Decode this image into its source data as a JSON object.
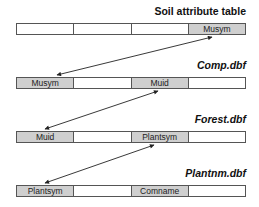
{
  "tables": [
    {
      "title": "Soil attribute table",
      "italic": false,
      "cells": [
        "",
        "",
        "",
        "Musym"
      ],
      "highlight": [
        3
      ]
    },
    {
      "title": "Comp.dbf",
      "italic": true,
      "cells": [
        "Musym",
        "",
        "Muid",
        ""
      ],
      "highlight": [
        0,
        2
      ]
    },
    {
      "title": "Forest.dbf",
      "italic": true,
      "cells": [
        "Muid",
        "",
        "Plantsym",
        ""
      ],
      "highlight": [
        0,
        2
      ]
    },
    {
      "title": "Plantnm.dbf",
      "italic": true,
      "cells": [
        "Plantsym",
        "",
        "Comname",
        ""
      ],
      "highlight": [
        0,
        2
      ]
    }
  ],
  "links": [
    {
      "from": "Soil attribute table.Musym",
      "to": "Comp.dbf.Musym"
    },
    {
      "from": "Comp.dbf.Muid",
      "to": "Forest.dbf.Muid"
    },
    {
      "from": "Forest.dbf.Plantsym",
      "to": "Plantnm.dbf.Plantsym"
    }
  ],
  "colors": {
    "highlight": "#cfcfcf",
    "border": "#555555",
    "text": "#111111"
  }
}
